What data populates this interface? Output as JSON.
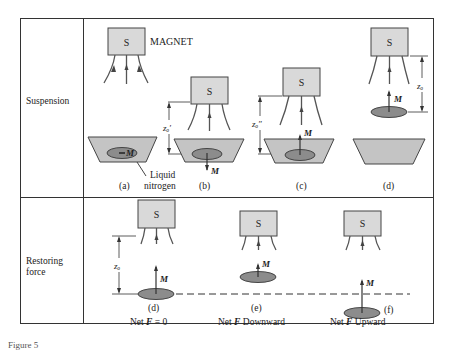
{
  "rows": [
    {
      "label": "Suspension"
    },
    {
      "label_line1": "Restoring",
      "label_line2": "force"
    }
  ],
  "magnet": {
    "pole": "S",
    "label": "MAGNET"
  },
  "suspension_panels": [
    {
      "id": "(a)",
      "moment_label": "M",
      "moment_dir": "horizontal-left"
    },
    {
      "id": "(b)",
      "moment_label": "M",
      "moment_dir": "down",
      "gap_label": "zₒ′"
    },
    {
      "id": "(c)",
      "moment_label": "M",
      "moment_dir": "up",
      "gap_label": "zₒ″"
    },
    {
      "id": "(d)",
      "moment_label": "M",
      "moment_dir": "up",
      "gap_label": "zₒ"
    }
  ],
  "liquid_label_line1": "Liquid",
  "liquid_label_line2": "nitrogen",
  "restoring_panels": [
    {
      "id": "(d)",
      "moment_label": "M",
      "gap_label": "zₒ",
      "net_force_prefix": "Net ",
      "net_force_var": "F",
      "net_force_suffix": " = 0"
    },
    {
      "id": "(e)",
      "moment_label": "M",
      "net_force_prefix": "Net ",
      "net_force_var": "F",
      "net_force_suffix": " Downward"
    },
    {
      "id": "(f)",
      "moment_label": "M",
      "net_force_prefix": "Net ",
      "net_force_var": "F",
      "net_force_suffix": " Upward"
    }
  ],
  "caption": "Figure 5",
  "colors": {
    "magnet_fill": "#d9d9d9",
    "disk_fill": "#8c8c8c",
    "dish_fill": "#c4c4c4",
    "line": "#333333",
    "field_line": "#555555"
  }
}
